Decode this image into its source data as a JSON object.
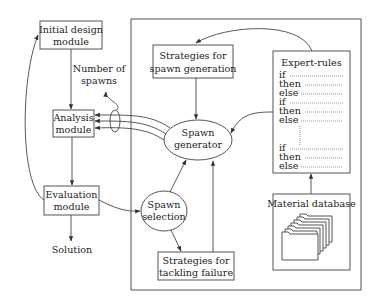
{
  "diagram": {
    "nodes": {
      "initial_design": {
        "line1": "Initial design",
        "line2": "module"
      },
      "analysis": {
        "line1": "Analysis",
        "line2": "module"
      },
      "evaluation": {
        "line1": "Evaluation",
        "line2": "module"
      },
      "solution": {
        "label": "Solution"
      },
      "number_of_spawns": {
        "line1": "Number of",
        "line2": "spawns"
      },
      "strategies_spawn": {
        "line1": "Strategies for",
        "line2": "spawn generation"
      },
      "spawn_generator": {
        "line1": "Spawn",
        "line2": "generator"
      },
      "spawn_selection": {
        "line1": "Spawn",
        "line2": "selection"
      },
      "strategies_failure": {
        "line1": "Strategies for",
        "line2": "tackling failure"
      },
      "expert_rules": {
        "title": "Expert-rules",
        "rules": [
          "if",
          "then",
          "else",
          "if",
          "then",
          "else",
          "if",
          "then",
          "else"
        ]
      },
      "material_database": {
        "title": "Material database"
      }
    },
    "colors": {
      "stroke": "#555555",
      "text": "#222222",
      "background": "#ffffff"
    }
  }
}
